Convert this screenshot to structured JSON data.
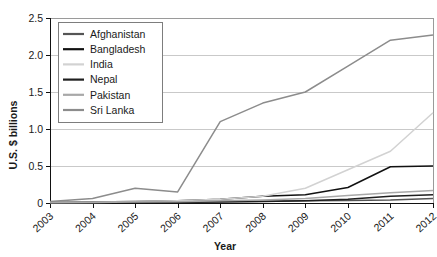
{
  "chart_data": {
    "type": "line",
    "title": "",
    "xlabel": "Year",
    "ylabel": "U.S. $ billions",
    "x": [
      2003,
      2004,
      2005,
      2006,
      2007,
      2008,
      2009,
      2010,
      2011,
      2012
    ],
    "xtick_labels": [
      "2003",
      "2004",
      "2005",
      "2006",
      "2007",
      "2008",
      "2009",
      "2010",
      "2011",
      "2012"
    ],
    "ytick_labels": [
      "0",
      "0.5",
      "1.0",
      "1.5",
      "2.0",
      "2.5"
    ],
    "yticks": [
      0,
      0.5,
      1.0,
      1.5,
      2.0,
      2.5
    ],
    "ylim": [
      0,
      2.5
    ],
    "xlim": [
      2003,
      2012
    ],
    "grid": "horizontal",
    "legend_position": "top-left-inside",
    "series": [
      {
        "name": "Afghanistan",
        "color": "#555555",
        "values": [
          0.005,
          0.008,
          0.012,
          0.015,
          0.02,
          0.025,
          0.03,
          0.035,
          0.04,
          0.06
        ]
      },
      {
        "name": "Bangladesh",
        "color": "#111111",
        "values": [
          0.01,
          0.015,
          0.02,
          0.03,
          0.05,
          0.09,
          0.11,
          0.21,
          0.49,
          0.5
        ]
      },
      {
        "name": "India",
        "color": "#d2d2d2",
        "values": [
          0.01,
          0.015,
          0.02,
          0.03,
          0.05,
          0.09,
          0.2,
          0.45,
          0.7,
          1.22
        ]
      },
      {
        "name": "Nepal",
        "color": "#1f1f1f",
        "values": [
          0.004,
          0.006,
          0.008,
          0.01,
          0.015,
          0.02,
          0.03,
          0.05,
          0.09,
          0.11
        ]
      },
      {
        "name": "Pakistan",
        "color": "#a8a8a8",
        "values": [
          0.005,
          0.008,
          0.012,
          0.018,
          0.03,
          0.04,
          0.06,
          0.1,
          0.14,
          0.17
        ]
      },
      {
        "name": "Sri Lanka",
        "color": "#8c8c8c",
        "values": [
          0.02,
          0.06,
          0.2,
          0.15,
          1.1,
          1.35,
          1.5,
          1.85,
          2.2,
          2.27
        ]
      }
    ]
  },
  "axes": {
    "y_title": "U.S. $ billions",
    "x_title": "Year"
  }
}
